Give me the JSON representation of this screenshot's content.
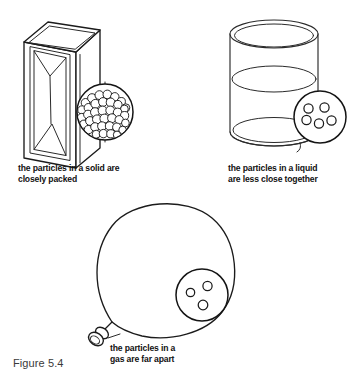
{
  "figure": {
    "label": "Figure 5.4",
    "background_color": "#ffffff",
    "ink_color": "#1b1b1b",
    "width": 360,
    "height": 379
  },
  "panels": [
    {
      "id": "solid",
      "state": "solid",
      "container_icon": "rectangular-block-icon",
      "caption": "the particles in a solid are\ncloasely packed",
      "caption_line_1": "the particles in a solid are",
      "caption_line_2": "closely packed",
      "particle_count": 38,
      "particle_arrangement": "closely-packed",
      "magnifier": {
        "cx": 105,
        "cy": 112,
        "r": 28
      }
    },
    {
      "id": "liquid",
      "state": "liquid",
      "container_icon": "beaker-icon",
      "caption_line_1": "the particles in a liquid",
      "caption_line_2": "are less close together",
      "particle_count": 5,
      "particle_arrangement": "less-close-together",
      "magnifier": {
        "cx": 320,
        "cy": 117,
        "r": 26
      }
    },
    {
      "id": "gas",
      "state": "gas",
      "container_icon": "balloon-icon",
      "caption_line_1": "the particles in a",
      "caption_line_2": "gas are far apart",
      "particle_count": 3,
      "particle_arrangement": "far-apart",
      "magnifier": {
        "cx": 202,
        "cy": 295,
        "r": 26
      }
    }
  ],
  "captions": {
    "solid": "the particles in a solid are\nclosely packed",
    "liquid": "the particles in a liquid\nare less close together",
    "gas": "the particles in a\ngas are far apart"
  },
  "particle_layouts": {
    "solid_dense": [
      [
        -19.5,
        -9.2,
        4.3
      ],
      [
        -13.0,
        -13.9,
        4.4
      ],
      [
        -5.6,
        -16.9,
        4.4
      ],
      [
        2.3,
        -17.6,
        4.3
      ],
      [
        9.8,
        -15.2,
        4.2
      ],
      [
        16.3,
        -10.4,
        4.1
      ],
      [
        20.8,
        -4.2,
        4.0
      ],
      [
        -23.0,
        -2.0,
        4.2
      ],
      [
        -16.6,
        -4.2,
        4.3
      ],
      [
        -9.6,
        -8.1,
        4.5
      ],
      [
        -2.0,
        -10.0,
        4.4
      ],
      [
        5.6,
        -9.6,
        4.4
      ],
      [
        12.9,
        -7.4,
        4.2
      ],
      [
        19.4,
        -3.0,
        3.9
      ],
      [
        -23.4,
        5.6,
        4.2
      ],
      [
        -17.0,
        2.6,
        4.4
      ],
      [
        -10.0,
        0.2,
        4.5
      ],
      [
        -2.4,
        -1.4,
        4.5
      ],
      [
        5.2,
        -1.6,
        4.4
      ],
      [
        12.6,
        0.4,
        4.3
      ],
      [
        19.6,
        3.6,
        4.1
      ],
      [
        -21.0,
        12.2,
        4.1
      ],
      [
        -15.0,
        9.0,
        4.4
      ],
      [
        -8.0,
        7.4,
        4.5
      ],
      [
        -0.6,
        6.6,
        4.5
      ],
      [
        7.0,
        6.2,
        4.4
      ],
      [
        14.2,
        7.8,
        4.2
      ],
      [
        20.4,
        11.0,
        3.9
      ],
      [
        -16.5,
        17.6,
        4.1
      ],
      [
        -10.0,
        15.0,
        4.3
      ],
      [
        -3.0,
        14.2,
        4.4
      ],
      [
        4.6,
        14.0,
        4.3
      ],
      [
        11.8,
        15.2,
        4.2
      ],
      [
        17.6,
        18.0,
        3.8
      ],
      [
        -8.8,
        22.2,
        4.0
      ],
      [
        -1.6,
        21.6,
        4.2
      ],
      [
        5.8,
        21.8,
        4.1
      ],
      [
        12.0,
        22.8,
        3.7
      ]
    ],
    "liquid_sparse": [
      [
        -11.5,
        -8.5,
        4.6
      ],
      [
        4.5,
        -9.5,
        4.6
      ],
      [
        -13.5,
        3.0,
        4.6
      ],
      [
        -1.0,
        6.5,
        4.6
      ],
      [
        11.5,
        3.5,
        4.6
      ]
    ],
    "gas_sparse": [
      [
        -11.5,
        -2.5,
        4.2
      ],
      [
        5.5,
        -9.0,
        4.6
      ],
      [
        1.0,
        10.0,
        4.8
      ]
    ]
  }
}
